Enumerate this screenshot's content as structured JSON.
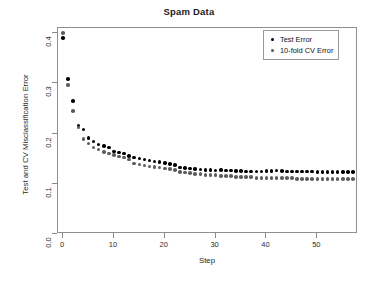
{
  "chart_data": {
    "type": "scatter",
    "title": "Spam Data",
    "xlabel": "Step",
    "ylabel": "Test and CV Misclassification Error",
    "xlim": [
      -1,
      58
    ],
    "ylim": [
      0.0,
      0.41
    ],
    "grid": false,
    "legend_position": "top-right",
    "xticks": [
      "0",
      "10",
      "20",
      "30",
      "40",
      "50"
    ],
    "xtick_values": [
      0,
      10,
      20,
      30,
      40,
      50
    ],
    "yticks": [
      "0.0",
      "0.1",
      "0.2",
      "0.3",
      "0.4"
    ],
    "ytick_values": [
      0.0,
      0.1,
      0.2,
      0.3,
      0.4
    ],
    "x": [
      0,
      1,
      2,
      3,
      4,
      5,
      6,
      7,
      8,
      9,
      10,
      11,
      12,
      13,
      14,
      15,
      16,
      17,
      18,
      19,
      20,
      21,
      22,
      23,
      24,
      25,
      26,
      27,
      28,
      29,
      30,
      31,
      32,
      33,
      34,
      35,
      36,
      37,
      38,
      39,
      40,
      41,
      42,
      43,
      44,
      45,
      46,
      47,
      48,
      49,
      50,
      51,
      52,
      53,
      54,
      55,
      56,
      57
    ],
    "series": [
      {
        "name": "Test Error",
        "color": "#000000",
        "marker": "filled-circle",
        "values": [
          0.39,
          0.308,
          0.265,
          0.216,
          0.208,
          0.191,
          0.184,
          0.178,
          0.175,
          0.172,
          0.164,
          0.162,
          0.16,
          0.155,
          0.152,
          0.15,
          0.148,
          0.146,
          0.144,
          0.143,
          0.141,
          0.139,
          0.137,
          0.132,
          0.131,
          0.13,
          0.129,
          0.128,
          0.127,
          0.127,
          0.126,
          0.127,
          0.126,
          0.126,
          0.125,
          0.125,
          0.124,
          0.124,
          0.124,
          0.124,
          0.125,
          0.125,
          0.126,
          0.125,
          0.124,
          0.124,
          0.124,
          0.124,
          0.124,
          0.124,
          0.123,
          0.123,
          0.123,
          0.123,
          0.123,
          0.123,
          0.123,
          0.123
        ]
      },
      {
        "name": "10-fold CV Error",
        "color": "#5d5d5d",
        "marker": "filled-circle",
        "values": [
          0.4,
          0.296,
          0.245,
          0.212,
          0.189,
          0.18,
          0.172,
          0.168,
          0.163,
          0.16,
          0.157,
          0.154,
          0.152,
          0.148,
          0.14,
          0.138,
          0.136,
          0.134,
          0.133,
          0.132,
          0.13,
          0.129,
          0.127,
          0.123,
          0.122,
          0.121,
          0.12,
          0.119,
          0.118,
          0.118,
          0.117,
          0.116,
          0.116,
          0.115,
          0.114,
          0.114,
          0.113,
          0.113,
          0.112,
          0.112,
          0.112,
          0.112,
          0.112,
          0.111,
          0.111,
          0.111,
          0.11,
          0.11,
          0.11,
          0.11,
          0.11,
          0.11,
          0.109,
          0.109,
          0.109,
          0.109,
          0.109,
          0.109
        ]
      }
    ]
  },
  "legend": {
    "entries": [
      {
        "label": "Test Error",
        "marker_name": "legend-dot-test"
      },
      {
        "label": "10-fold CV Error",
        "marker_name": "legend-dot-cv"
      }
    ]
  }
}
